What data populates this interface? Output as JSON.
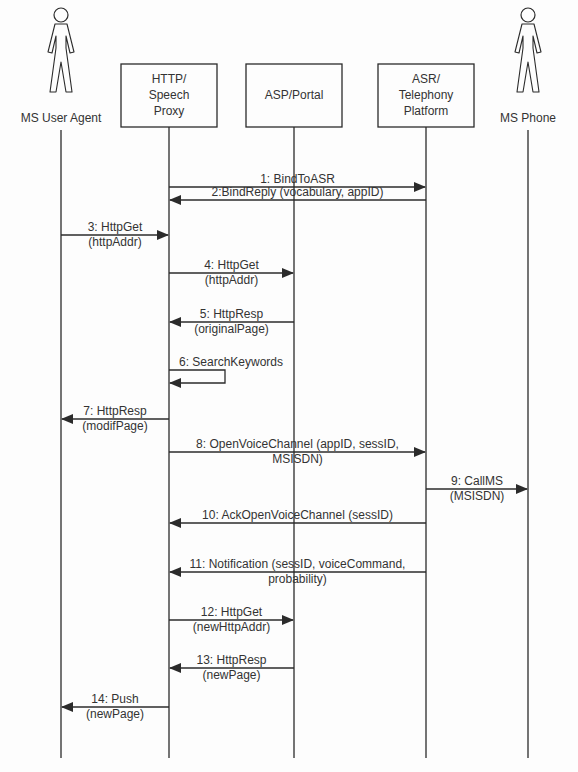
{
  "participants": [
    {
      "id": "ua",
      "label_lines": [
        "MS User Agent"
      ],
      "type": "actor",
      "x": 61
    },
    {
      "id": "proxy",
      "label_lines": [
        "HTTP/",
        "Speech",
        "Proxy"
      ],
      "type": "box",
      "x": 169
    },
    {
      "id": "asp",
      "label_lines": [
        "ASP/Portal"
      ],
      "type": "box",
      "x": 294
    },
    {
      "id": "asr",
      "label_lines": [
        "ASR/",
        "Telephony",
        "Platform"
      ],
      "type": "box",
      "x": 426
    },
    {
      "id": "phone",
      "label_lines": [
        "MS Phone"
      ],
      "type": "actor",
      "x": 528
    }
  ],
  "messages": [
    {
      "n": 1,
      "from": "proxy",
      "to": "asr",
      "y": 187,
      "lines": [
        "1: BindToASR"
      ]
    },
    {
      "n": 2,
      "from": "asr",
      "to": "proxy",
      "y": 200,
      "lines": [
        "2:BindReply (vocabulary, appID)"
      ]
    },
    {
      "n": 3,
      "from": "ua",
      "to": "proxy",
      "y": 235,
      "lines": [
        "3: HttpGet",
        "(httpAddr)"
      ]
    },
    {
      "n": 4,
      "from": "proxy",
      "to": "asp",
      "y": 273,
      "lines": [
        "4: HttpGet",
        "(httpAddr)"
      ]
    },
    {
      "n": 5,
      "from": "asp",
      "to": "proxy",
      "y": 322,
      "lines": [
        "5: HttpResp",
        "(originalPage)"
      ]
    },
    {
      "n": 6,
      "from": "proxy",
      "to": "proxy",
      "y": 370,
      "lines": [
        "6: SearchKeywords"
      ]
    },
    {
      "n": 7,
      "from": "proxy",
      "to": "ua",
      "y": 419,
      "lines": [
        "7: HttpResp",
        "(modifPage)"
      ]
    },
    {
      "n": 8,
      "from": "proxy",
      "to": "asr",
      "y": 452,
      "lines": [
        "8: OpenVoiceChannel (appID, sessID,",
        "MSISDN)"
      ]
    },
    {
      "n": 9,
      "from": "asr",
      "to": "phone",
      "y": 489,
      "lines": [
        "9: CallMS",
        "(MSISDN)"
      ]
    },
    {
      "n": 10,
      "from": "asr",
      "to": "proxy",
      "y": 523,
      "lines": [
        "10: AckOpenVoiceChannel (sessID)"
      ]
    },
    {
      "n": 11,
      "from": "asr",
      "to": "proxy",
      "y": 572,
      "lines": [
        "11: Notification (sessID, voiceCommand,",
        "probability)"
      ]
    },
    {
      "n": 12,
      "from": "proxy",
      "to": "asp",
      "y": 620,
      "lines": [
        "12: HttpGet",
        "(newHttpAddr)"
      ]
    },
    {
      "n": 13,
      "from": "asp",
      "to": "proxy",
      "y": 668,
      "lines": [
        "13: HttpResp",
        "(newPage)"
      ]
    },
    {
      "n": 14,
      "from": "proxy",
      "to": "ua",
      "y": 707,
      "lines": [
        "14: Push",
        "(newPage)"
      ]
    }
  ],
  "colors": {
    "line": "#2b2b2b",
    "text": "#333333",
    "background": "#fdfdfd"
  }
}
